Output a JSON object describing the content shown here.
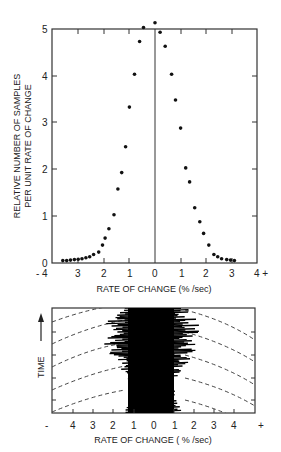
{
  "chart_data": [
    {
      "type": "scatter",
      "title": "",
      "xlabel": "RATE OF CHANGE (%/sec)",
      "ylabel": "RELATIVE NUMBER OF SAMPLES PER UNIT RATE OF CHANGE",
      "xlim": [
        -4,
        4
      ],
      "ylim": [
        0,
        5
      ],
      "x_ticks": [
        "- 4",
        "3",
        "2",
        "1",
        "0",
        "1",
        "2",
        "3",
        "4 +"
      ],
      "y_ticks": [
        "0",
        "1",
        "2",
        "3",
        "4",
        "5"
      ],
      "grid": false,
      "vertical_reference_line_at": 0,
      "x": [
        -3.6,
        -3.45,
        -3.3,
        -3.15,
        -3.0,
        -2.85,
        -2.7,
        -2.55,
        -2.4,
        -2.2,
        -2.05,
        -1.95,
        -1.8,
        -1.6,
        -1.45,
        -1.3,
        -1.15,
        -1.0,
        -0.8,
        -0.6,
        -0.45,
        0.0,
        0.2,
        0.4,
        0.65,
        0.8,
        1.0,
        1.2,
        1.35,
        1.55,
        1.75,
        1.9,
        2.1,
        2.3,
        2.45,
        2.6,
        2.8,
        2.95,
        3.1
      ],
      "values": [
        0.02,
        0.02,
        0.03,
        0.04,
        0.05,
        0.06,
        0.08,
        0.1,
        0.15,
        0.2,
        0.35,
        0.5,
        0.7,
        1.0,
        1.55,
        1.9,
        2.45,
        3.3,
        4.0,
        4.7,
        5.0,
        5.1,
        4.9,
        4.6,
        4.0,
        3.45,
        2.85,
        2.0,
        1.7,
        1.15,
        0.85,
        0.6,
        0.35,
        0.15,
        0.1,
        0.06,
        0.04,
        0.03,
        0.02
      ]
    },
    {
      "type": "area",
      "title": "",
      "xlabel": "RATE OF CHANGE (%/sec)",
      "ylabel": "TIME",
      "xlim": [
        -5,
        5
      ],
      "x_ticks": [
        "-",
        "4",
        "3",
        "2",
        "1",
        "0",
        "1",
        "2",
        "3",
        "4",
        "+"
      ],
      "description": "Time trace of rate of change: dense black band concentrated between about -1.5 and +1.5 %/sec, with dashed curved reference lines on both sides"
    }
  ],
  "upper": {
    "ylabel_line1": "RELATIVE NUMBER OF SAMPLES",
    "ylabel_line2": "PER UNIT RATE OF CHANGE",
    "xlabel": "RATE OF CHANGE  (% /sec)",
    "xticks": [
      "- 4",
      "3",
      "2",
      "1",
      "0",
      "1",
      "2",
      "3",
      "4 +"
    ],
    "yticks": [
      "0",
      "1",
      "2",
      "3",
      "4",
      "5"
    ]
  },
  "lower": {
    "ylabel": "TIME",
    "xlabel": "RATE OF CHANGE  ( % /sec)",
    "xticks": [
      "-",
      "4",
      "3",
      "2",
      "1",
      "0",
      "1",
      "2",
      "3",
      "4",
      "+"
    ]
  }
}
